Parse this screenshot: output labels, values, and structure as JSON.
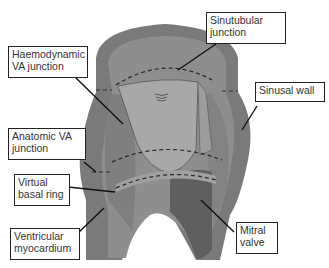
{
  "figure": {
    "colors": {
      "wall_outer": "#7a7a7a",
      "wall_inner": "#8c8c8c",
      "wall_cut": "#6e6e6e",
      "leaflet": "#a6a6a6",
      "mitral": "#5e5e5e",
      "dashed_line": "#2a2a2a",
      "ring_band": "#9a9a9a"
    }
  },
  "labels": {
    "sinutubular": "Sinutubular\njunction",
    "haemodynamic": "Haemodynamic\nVA junction",
    "sinusal_wall": "Sinusal wall",
    "anatomic": "Anatomic VA\njunction",
    "virtual_ring": "Virtual\nbasal ring",
    "ventricular": "Ventricular\nmyocardium",
    "mitral": "Mitral\nvalve"
  }
}
